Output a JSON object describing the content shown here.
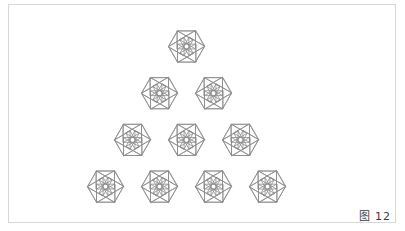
{
  "figure": {
    "caption": "图 12",
    "caption_label": "Figure 12",
    "frame": {
      "border_color": "#d8d8d8",
      "background": "#ffffff",
      "x": 8,
      "y": 4,
      "width": 388,
      "height": 219
    }
  },
  "chart_data": {
    "type": "diagram",
    "subtype": "geometric-tiling",
    "title": "图 12",
    "tiling_name": "rhombitrihexagonal tiling",
    "vertex_configuration": "3.4.6.4",
    "polygons": [
      "hexagon",
      "square",
      "triangle"
    ],
    "stroke_color": "#8a8a8a",
    "stroke_width": 0.8,
    "fill": "none",
    "geometry": {
      "edge_length": 18,
      "hexagon_centers_rows": [
        {
          "row": 1,
          "count": 1,
          "cy": 46.5,
          "cxs": [
            186.5
          ]
        },
        {
          "row": 2,
          "count": 2,
          "cy": 93.2,
          "cxs": [
            159.5,
            213.5
          ]
        },
        {
          "row": 3,
          "count": 3,
          "cy": 139.9,
          "cxs": [
            132.5,
            186.5,
            240.5
          ]
        },
        {
          "row": 4,
          "count": 4,
          "cy": 186.6,
          "cxs": [
            105.5,
            159.5,
            213.5,
            267.5
          ]
        }
      ],
      "row_counts": [
        1,
        2,
        3,
        4
      ],
      "total_hexagons": 10,
      "bottom_pendant_squares": 4,
      "hex_row_spacing": 46.7,
      "hex_col_spacing": 54.0
    },
    "annotations": [],
    "legend": [],
    "grid": false
  }
}
